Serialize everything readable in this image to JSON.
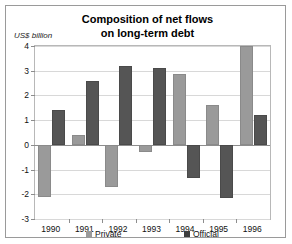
{
  "chart_data": {
    "type": "bar",
    "title": "Composition of net flows on long-term debt",
    "title_line1": "Composition of net flows",
    "title_line2": "on long-term debt",
    "ylabel": "US$ billion",
    "xlabel": "",
    "categories": [
      "1990",
      "1991",
      "1992",
      "1993",
      "1994",
      "1995",
      "1996"
    ],
    "series": [
      {
        "name": "Private",
        "color": "#9a9a9a",
        "values": [
          -2.1,
          0.4,
          -1.7,
          -0.3,
          2.85,
          1.6,
          4.0
        ]
      },
      {
        "name": "Official",
        "color": "#3d3d3d",
        "values": [
          1.4,
          2.6,
          3.2,
          3.1,
          -1.35,
          -2.15,
          1.2
        ]
      }
    ],
    "ylim": [
      -3,
      4
    ],
    "yticks": [
      4,
      3,
      2,
      1,
      0,
      -1,
      -2,
      -3
    ],
    "ytick_labels": [
      "4",
      "3",
      "2",
      "1",
      "0",
      "-1",
      "-2",
      "-3"
    ],
    "grid": true,
    "legend_position": "bottom"
  },
  "legend": {
    "entries": [
      {
        "label": "Private"
      },
      {
        "label": "Official"
      }
    ]
  }
}
